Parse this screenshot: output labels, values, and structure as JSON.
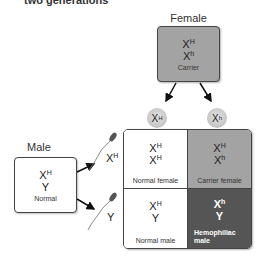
{
  "title": "two generations",
  "female": {
    "label": "Female",
    "allele1": {
      "base": "X",
      "sup": "H"
    },
    "allele2": {
      "base": "X",
      "sup": "h"
    },
    "status": "Carrier",
    "color": "#a3a3a3"
  },
  "eggs": [
    {
      "base": "X",
      "sup": "H"
    },
    {
      "base": "X",
      "sup": "h"
    }
  ],
  "male": {
    "label": "Male",
    "allele1": {
      "base": "X",
      "sup": "H"
    },
    "allele2": {
      "base": "Y",
      "sup": ""
    },
    "status": "Normal",
    "color": "#ffffff"
  },
  "sperm": [
    {
      "base": "X",
      "sup": "H"
    },
    {
      "base": "Y",
      "sup": ""
    }
  ],
  "punnett": {
    "cells": [
      {
        "a1": {
          "base": "X",
          "sup": "H"
        },
        "a2": {
          "base": "X",
          "sup": "H"
        },
        "label": "Normal female",
        "color": "#ffffff"
      },
      {
        "a1": {
          "base": "X",
          "sup": "H"
        },
        "a2": {
          "base": "X",
          "sup": "h"
        },
        "label": "Carrier female",
        "color": "#a3a3a3"
      },
      {
        "a1": {
          "base": "X",
          "sup": "H"
        },
        "a2": {
          "base": "Y",
          "sup": ""
        },
        "label": "Normal male",
        "color": "#ffffff"
      },
      {
        "a1": {
          "base": "X",
          "sup": "h"
        },
        "a2": {
          "base": "Y",
          "sup": ""
        },
        "label": "Hemophiliac male",
        "color": "#555555"
      }
    ]
  }
}
